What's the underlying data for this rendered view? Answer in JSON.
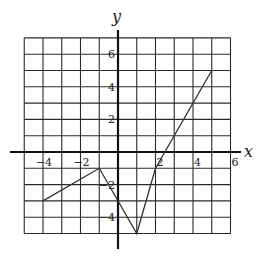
{
  "chart_data": {
    "type": "line",
    "title": "",
    "xlabel": "x",
    "ylabel": "y",
    "xlim": [
      -5,
      6
    ],
    "ylim": [
      -5,
      7
    ],
    "grid": true,
    "x_ticks": [
      -4,
      -2,
      2,
      4,
      6
    ],
    "y_ticks": [
      -4,
      -2,
      2,
      4,
      6
    ],
    "x_tick_labels": [
      "−4",
      "−2",
      "2",
      "4",
      "6"
    ],
    "y_tick_labels": [
      "−4",
      "−2",
      "2",
      "4",
      "6"
    ],
    "series": [
      {
        "name": "piecewise linear function",
        "points": [
          [
            -4,
            -3
          ],
          [
            -1,
            -1
          ],
          [
            1,
            -5
          ],
          [
            2,
            -1
          ],
          [
            5,
            5
          ]
        ]
      }
    ]
  }
}
